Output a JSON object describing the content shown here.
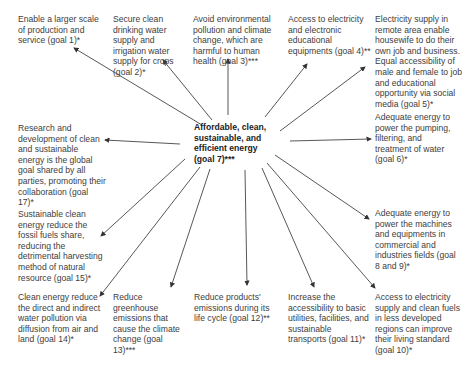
{
  "diagram": {
    "center": {
      "text": "Affordable, clean, sustainable, and efficient energy (goal 7)***"
    },
    "nodes": [
      {
        "id": "goal1",
        "text": "Enable a larger scale of production and service (goal 1)*"
      },
      {
        "id": "goal2",
        "text": "Secure clean drinking water supply and irrigation water supply for crops (goal 2)*"
      },
      {
        "id": "goal3",
        "text": "Avoid environmental pollution and climate change, which are harmful to human health (goal 3)***"
      },
      {
        "id": "goal4",
        "text": "Access to electricity and electronic educational equipments (goal 4)**"
      },
      {
        "id": "goal5",
        "text": "Electricity supply in remote area enable housewife to do their own job and business. Equal accessibility of male and female to job and educational opportunity via social media (goal 5)*"
      },
      {
        "id": "goal6",
        "text": "Adequate energy to power the pumping, filtering, and treatment of water (goal 6)*"
      },
      {
        "id": "goal8_9",
        "text": "Adequate energy to power the machines and equipments in commercial and industries fields (goal 8 and 9)*"
      },
      {
        "id": "goal10",
        "text": "Access to electricity supply and clean fuels in less developed regions can improve their living standard (goal 10)*"
      },
      {
        "id": "goal11",
        "text": "Increase the accessibility to basic utilities, facilities, and sustainable transports (goal 11)*"
      },
      {
        "id": "goal12",
        "text": "Reduce products' emissions during its life cycle (goal 12)**"
      },
      {
        "id": "goal13",
        "text": "Reduce greenhouse emissions that cause the climate change (goal 13)***"
      },
      {
        "id": "goal14",
        "text": "Clean energy reduce the direct and indirect water pollution via diffusion from air and land (goal 14)*"
      },
      {
        "id": "goal15",
        "text": "Sustainable clean energy reduce the fossil fuels share, reducing the detrimental harvesting method of natural resource (goal 15)*"
      },
      {
        "id": "goal17",
        "text": "Research and development of clean and sustainable energy is the global goal shared by all parties, promoting their collaboration (goal 17)*"
      }
    ]
  }
}
